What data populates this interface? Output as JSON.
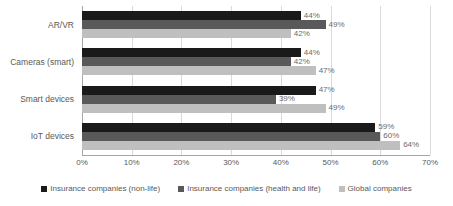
{
  "chart_data": {
    "type": "bar",
    "orientation": "horizontal",
    "title": "",
    "subtitle": "",
    "xlabel": "",
    "ylabel": "",
    "xlim": [
      0,
      70
    ],
    "xtick_step": 10,
    "grid": true,
    "value_suffix": "%",
    "legend_position": "bottom",
    "categories": [
      "AR/VR",
      "Cameras (smart)",
      "Smart devices",
      "IoT devices"
    ],
    "series": [
      {
        "name": "Insurance companies (non-life)",
        "color": "#1a1a1a",
        "values": [
          44,
          44,
          47,
          59
        ],
        "labels": [
          "44%",
          "44%",
          "47%",
          "59%"
        ]
      },
      {
        "name": "Insurance companies (health and life)",
        "color": "#595959",
        "values": [
          49,
          42,
          39,
          60
        ],
        "labels": [
          "49%",
          "42%",
          "39%",
          "60%"
        ]
      },
      {
        "name": "Global companies",
        "color": "#bfbfbf",
        "values": [
          42,
          47,
          49,
          64
        ],
        "labels": [
          "42%",
          "47%",
          "49%",
          "64%"
        ]
      }
    ],
    "xticks": [
      "0%",
      "10%",
      "20%",
      "30%",
      "40%",
      "50%",
      "60%",
      "70%"
    ],
    "axis_color": "#a6a6a6",
    "grid_color": "#d9d9d9",
    "text_color": "#595959"
  },
  "legend": {
    "items": [
      {
        "label": "Insurance companies (non-life)",
        "color": "#1a1a1a"
      },
      {
        "label": "Insurance companies (health and life)",
        "color": "#595959"
      },
      {
        "label": "Global companies",
        "color": "#bfbfbf"
      }
    ]
  }
}
